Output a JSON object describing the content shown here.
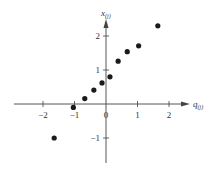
{
  "chart_data": {
    "type": "scatter",
    "title": "",
    "xlabel": "q(j)",
    "ylabel": "x(j)",
    "xlabel_main": "q",
    "xlabel_sub": "(j)",
    "ylabel_main": "x",
    "ylabel_sub": "(j)",
    "xlim": [
      -2.8,
      2.3
    ],
    "ylim": [
      -1.5,
      2.5
    ],
    "xticks": [
      -2,
      -1,
      0,
      1,
      2
    ],
    "yticks": [
      -1,
      1,
      2
    ],
    "xtick_labels": [
      "−2",
      "−1",
      "0",
      "1",
      "2"
    ],
    "ytick_labels": [
      "−1",
      "1",
      "2"
    ],
    "grid": false,
    "legend": null,
    "series": [
      {
        "name": "ordered observations vs standard normal quantiles",
        "color": "#1a1a1a",
        "points": [
          {
            "x": -1.645,
            "y": -1.0
          },
          {
            "x": -1.036,
            "y": -0.1
          },
          {
            "x": -0.674,
            "y": 0.16
          },
          {
            "x": -0.385,
            "y": 0.41
          },
          {
            "x": -0.126,
            "y": 0.62
          },
          {
            "x": 0.126,
            "y": 0.8
          },
          {
            "x": 0.385,
            "y": 1.26
          },
          {
            "x": 0.674,
            "y": 1.54
          },
          {
            "x": 1.036,
            "y": 1.71
          },
          {
            "x": 1.645,
            "y": 2.3
          }
        ]
      }
    ]
  },
  "colors": {
    "axis": "#444444",
    "point": "#1a1a1a",
    "background": "#ffffff"
  }
}
